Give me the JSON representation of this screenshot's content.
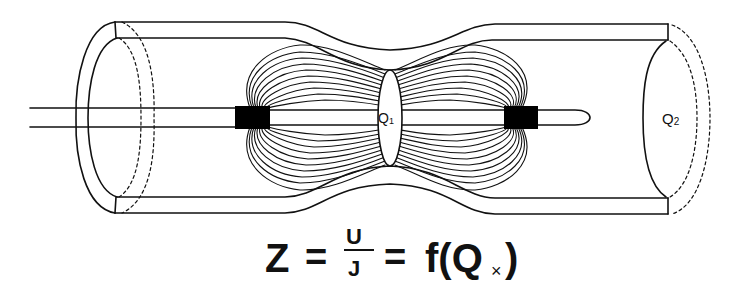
{
  "diagram": {
    "type": "coaxial conductivity cell with constriction and field lines",
    "labels": {
      "q1": "Q",
      "q1_sub": "1",
      "q2": "Q",
      "q2_sub": "2"
    },
    "colors": {
      "line": "#111111",
      "background": "#ffffff",
      "electrode": "#000000"
    }
  },
  "formula": {
    "lhs": "Z",
    "eq1": "=",
    "numerator": "U",
    "denominator": "J",
    "eq2": "=",
    "func": "f(Q",
    "sub": "×",
    "close": ")"
  }
}
